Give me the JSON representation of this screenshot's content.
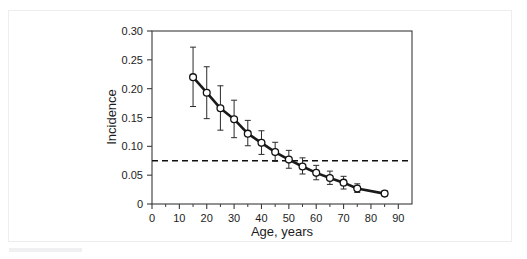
{
  "chart_data": {
    "type": "line",
    "title": "",
    "subtitle": "",
    "xlabel": "Age, years",
    "ylabel": "Incidence",
    "xlim": [
      0,
      95
    ],
    "ylim": [
      0,
      0.3
    ],
    "grid": false,
    "legend": null,
    "x_ticks": [
      0,
      10,
      20,
      30,
      40,
      50,
      60,
      70,
      80,
      90
    ],
    "x_tick_labels": [
      "0",
      "10",
      "20",
      "30",
      "40",
      "50",
      "60",
      "70",
      "80",
      "90"
    ],
    "x_minor_ticks": [
      5,
      15,
      25,
      35,
      45,
      55,
      65,
      75,
      85
    ],
    "y_ticks": [
      0,
      0.05,
      0.1,
      0.15,
      0.2,
      0.25,
      0.3
    ],
    "y_tick_labels": [
      "0",
      "0.05",
      "0.10",
      "0.15",
      "0.20",
      "0.25",
      "0.30"
    ],
    "marker": "open-circle",
    "line_color": "#1a1a1a",
    "marker_face_color": "#ffffff",
    "marker_edge_color": "#111111",
    "error_bar_color": "#2a2a2a",
    "x": [
      15,
      20,
      25,
      30,
      35,
      40,
      45,
      50,
      55,
      60,
      65,
      70,
      75,
      85
    ],
    "values": [
      0.22,
      0.193,
      0.166,
      0.147,
      0.122,
      0.106,
      0.09,
      0.077,
      0.065,
      0.054,
      0.045,
      0.037,
      0.027,
      0.018
    ],
    "error_low": [
      0.169,
      0.148,
      0.128,
      0.115,
      0.101,
      0.086,
      0.074,
      0.062,
      0.052,
      0.042,
      0.034,
      0.026,
      0.02,
      0.014
    ],
    "error_high": [
      0.272,
      0.238,
      0.205,
      0.18,
      0.145,
      0.127,
      0.107,
      0.093,
      0.08,
      0.067,
      0.057,
      0.048,
      0.035,
      0.023
    ],
    "annotations": [
      {
        "name": "threshold-line",
        "type": "hline",
        "value": 0.075,
        "style": "dashed",
        "color": "#111111",
        "label": ""
      }
    ]
  }
}
